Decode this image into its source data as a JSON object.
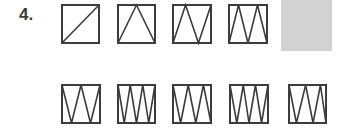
{
  "question": {
    "number_label": "4."
  },
  "colors": {
    "stroke": "#3c3c3c",
    "answer_placeholder": "#d2d2d2"
  },
  "sequence": [
    {
      "x": 61,
      "y": 4,
      "w": 39,
      "h": 40,
      "points": [
        [
          0,
          1
        ],
        [
          1,
          0
        ]
      ]
    },
    {
      "x": 117,
      "y": 4,
      "w": 39,
      "h": 40,
      "points": [
        [
          0,
          1
        ],
        [
          0.5,
          0
        ],
        [
          1,
          1
        ]
      ]
    },
    {
      "x": 172,
      "y": 4,
      "w": 40,
      "h": 40,
      "points": [
        [
          0,
          1
        ],
        [
          0.33,
          0
        ],
        [
          0.67,
          1
        ],
        [
          1,
          0
        ]
      ]
    },
    {
      "x": 228,
      "y": 4,
      "w": 40,
      "h": 40,
      "points": [
        [
          0,
          1
        ],
        [
          0.25,
          0
        ],
        [
          0.5,
          1
        ],
        [
          0.75,
          0
        ],
        [
          1,
          1
        ]
      ]
    }
  ],
  "answer_slot": {
    "label": ""
  },
  "options": [
    {
      "x": 61,
      "y": 84,
      "w": 40,
      "h": 40,
      "points": [
        [
          0,
          0
        ],
        [
          0.25,
          1
        ],
        [
          0.5,
          0
        ],
        [
          0.75,
          1
        ],
        [
          1,
          0
        ]
      ]
    },
    {
      "x": 117,
      "y": 84,
      "w": 39,
      "h": 40,
      "points": [
        [
          0,
          0
        ],
        [
          0.17,
          1
        ],
        [
          0.33,
          0
        ],
        [
          0.5,
          1
        ],
        [
          0.67,
          0
        ],
        [
          0.83,
          1
        ],
        [
          1,
          0
        ]
      ]
    },
    {
      "x": 172,
      "y": 84,
      "w": 40,
      "h": 40,
      "points": [
        [
          0,
          0
        ],
        [
          0.2,
          1
        ],
        [
          0.4,
          0
        ],
        [
          0.6,
          1
        ],
        [
          0.8,
          0
        ],
        [
          1,
          1
        ]
      ]
    },
    {
      "x": 229,
      "y": 84,
      "w": 40,
      "h": 40,
      "points": [
        [
          0,
          0
        ],
        [
          0.18,
          1
        ],
        [
          0.35,
          0
        ],
        [
          0.5,
          1
        ],
        [
          0.67,
          0
        ],
        [
          0.83,
          1
        ],
        [
          1,
          0
        ]
      ]
    },
    {
      "x": 288,
      "y": 84,
      "w": 39,
      "h": 40,
      "points": [
        [
          0,
          0
        ],
        [
          0.2,
          1
        ],
        [
          0.45,
          0
        ],
        [
          0.65,
          1
        ],
        [
          0.85,
          0
        ],
        [
          1,
          1
        ]
      ]
    }
  ]
}
